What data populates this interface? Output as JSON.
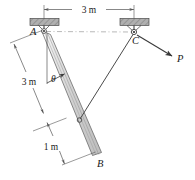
{
  "figure": {
    "colors": {
      "line": "#3a3a3a",
      "bar_fill": "#d9d9d9",
      "bar_edge": "#6b6b6b",
      "support_fill": "#a8a8a8",
      "support_edge": "#4a4a4a",
      "dimension": "#555555",
      "dashed": "#9a9a9a"
    },
    "labels": {
      "point_a": "A",
      "point_b": "B",
      "point_c": "C",
      "force_p": "P",
      "angle_theta": "θ"
    },
    "dimensions": {
      "top_span": "3 m",
      "left_span": "3 m",
      "bottom_span": "1 m"
    },
    "geometry": {
      "pin_a": [
        44,
        31
      ],
      "pin_c": [
        134,
        32
      ],
      "bar_top": [
        46,
        33
      ],
      "bar_bottom": [
        97,
        151
      ],
      "cable_attach": [
        79,
        120
      ],
      "force_tip": [
        178,
        59
      ]
    },
    "elements": [
      "ceiling-support-left",
      "ceiling-support-right",
      "pin-a",
      "pin-c",
      "slender-bar-ab",
      "cable-c-to-bar",
      "force-arrow-p",
      "angle-theta-marker",
      "dimension-top-3m",
      "dimension-left-3m",
      "dimension-bottom-1m",
      "horizontal-datum-dashed"
    ]
  }
}
